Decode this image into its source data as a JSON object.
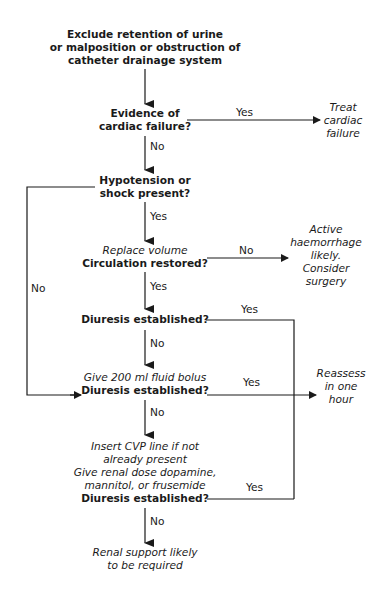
{
  "flowchart": {
    "start": [
      "Exclude retention of urine",
      "or malposition or obstruction of",
      "catheter drainage system"
    ],
    "q1": [
      "Evidence of",
      "cardiac failure?"
    ],
    "q1_yes_outcome": [
      "Treat",
      "cardiac",
      "failure"
    ],
    "q2": [
      "Hypotension or",
      "shock present?"
    ],
    "q3_action": "Replace volume",
    "q3": "Circulation restored?",
    "q3_no_outcome": [
      "Active",
      "haemorrhage",
      "likely.",
      "Consider",
      "surgery"
    ],
    "q4": "Diuresis established?",
    "q5_action": "Give 200 ml fluid bolus",
    "q5": "Diuresis established?",
    "reassess_outcome": [
      "Reassess",
      "in one",
      "hour"
    ],
    "q6_action": [
      "Insert CVP line if not",
      "already present",
      "Give renal dose dopamine,",
      "mannitol, or frusemide"
    ],
    "q6": "Diuresis established?",
    "end": [
      "Renal support likely",
      "to be required"
    ],
    "labels": {
      "q1_yes": "Yes",
      "q1_no": "No",
      "q2_yes": "Yes",
      "q2_no": "No",
      "q3_no": "No",
      "q3_yes": "Yes",
      "q4_yes": "Yes",
      "q4_no": "No",
      "q5_yes": "Yes",
      "q5_no": "No",
      "q6_yes": "Yes",
      "q6_no": "No"
    }
  }
}
